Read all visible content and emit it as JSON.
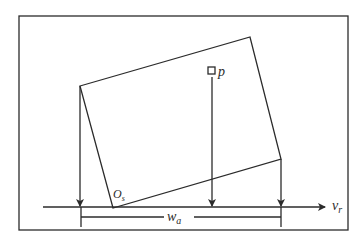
{
  "diagram": {
    "type": "geometric-projection",
    "colors": {
      "line": "#2b2b2b",
      "background": "#ffffff"
    },
    "frame": {
      "x": 19,
      "y": 16,
      "width": 329,
      "height": 214
    },
    "rectangle": {
      "corners": [
        {
          "name": "top-left",
          "x": 80,
          "y": 86
        },
        {
          "name": "top-right",
          "x": 250,
          "y": 37
        },
        {
          "name": "bottom-right",
          "x": 281,
          "y": 159
        },
        {
          "name": "bottom-left",
          "x": 113,
          "y": 208
        }
      ]
    },
    "point": {
      "x": 211,
      "y": 71,
      "label": "p"
    },
    "origin": {
      "x": 113,
      "y": 208,
      "label_main": "O",
      "label_sub": "s"
    },
    "axis": {
      "y": 207,
      "x_start": 43,
      "x_end": 325,
      "label_main": "v",
      "label_sub": "r"
    },
    "projections": [
      {
        "name": "left-corner-projection",
        "x": 80,
        "y_start": 86
      },
      {
        "name": "point-p-projection",
        "x": 212,
        "y_start": 77
      },
      {
        "name": "right-corner-projection",
        "x": 281,
        "y_start": 159
      }
    ],
    "dimension": {
      "x_start": 81,
      "x_end": 281,
      "y": 217,
      "tick_bottom": 227,
      "label_main": "w",
      "label_sub": "a"
    }
  }
}
